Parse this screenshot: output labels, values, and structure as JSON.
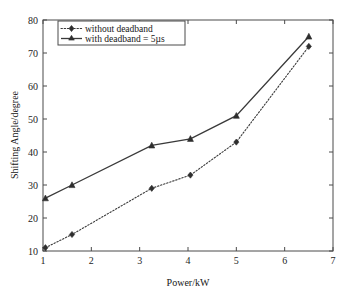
{
  "chart_data": {
    "type": "line",
    "title": "",
    "xlabel": "Power/kW",
    "ylabel": "Shifting Angle/degree",
    "xlim": [
      1,
      7
    ],
    "ylim": [
      10,
      80
    ],
    "xticks": [
      1,
      2,
      3,
      4,
      5,
      6,
      7
    ],
    "yticks": [
      10,
      20,
      30,
      40,
      50,
      60,
      70,
      80
    ],
    "xtick_labels": [
      "1",
      "2",
      "3",
      "4",
      "5",
      "6",
      "7"
    ],
    "ytick_labels": [
      "10",
      "20",
      "30",
      "40",
      "50",
      "60",
      "70",
      "80"
    ],
    "grid": false,
    "legend_position": "upper left",
    "series": [
      {
        "name": "without deadband",
        "line_style": "dotted",
        "marker": "diamond",
        "color": "#3a3a3a",
        "x": [
          1.05,
          1.6,
          3.25,
          4.05,
          5.0,
          6.5
        ],
        "values": [
          11,
          15,
          29,
          33,
          43,
          72
        ]
      },
      {
        "name": "with deadband = 5µs",
        "line_style": "solid",
        "marker": "triangle",
        "color": "#3a3a3a",
        "x": [
          1.05,
          1.6,
          3.25,
          4.05,
          5.0,
          6.5
        ],
        "values": [
          26,
          30,
          42,
          44,
          51,
          75
        ]
      }
    ]
  },
  "legend": {
    "entries": [
      {
        "label": "without deadband"
      },
      {
        "label": "with deadband = 5µs"
      }
    ]
  },
  "axes": {
    "x_title": "Power/kW",
    "y_title": "Shifting Angle/degree"
  }
}
